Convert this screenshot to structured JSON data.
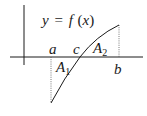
{
  "diagram": {
    "function_label": "y = f(x)",
    "function_label_parts": {
      "y": "y",
      "eq": "=",
      "f": "f",
      "open": "(",
      "x": "x",
      "close": ")"
    },
    "points": {
      "a": "a",
      "c": "c",
      "b": "b"
    },
    "areas": {
      "A1": {
        "base": "A",
        "sub": "1"
      },
      "A2": {
        "base": "A",
        "sub": "2"
      }
    },
    "colors": {
      "stroke": "#1a1a1a",
      "dotted": "#555555",
      "background": "#ffffff"
    }
  }
}
